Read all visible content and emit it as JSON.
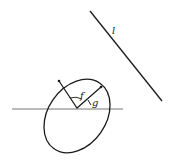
{
  "diagram": {
    "labels": {
      "line": "l",
      "f": "f",
      "g": "g"
    },
    "colors": {
      "stroke": "#1a1a1a",
      "axis": "#777777",
      "background": "#ffffff"
    }
  }
}
